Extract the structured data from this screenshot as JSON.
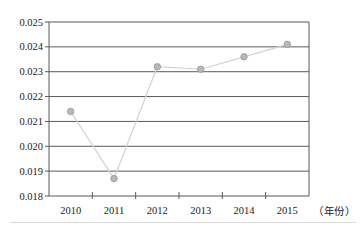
{
  "chart_data": {
    "type": "line",
    "categories": [
      "2010",
      "2011",
      "2012",
      "2013",
      "2014",
      "2015"
    ],
    "series": [
      {
        "name": "series-1",
        "values": [
          0.0214,
          0.0187,
          0.0232,
          0.0231,
          0.0236,
          0.0241
        ]
      }
    ],
    "title": "",
    "xlabel": "（年份）",
    "ylabel": "",
    "ylim": [
      0.018,
      0.025
    ],
    "ytick_step": 0.001,
    "ytick_decimals": 3,
    "grid": "horizontal-only",
    "legend": "none",
    "marker": "circle",
    "colors": {
      "line": "#d5d2c8",
      "marker_fill": "#b8b8b8",
      "marker_stroke": "#9f9f9f",
      "grid": "#595959",
      "axis": "#595959",
      "tick_label": "#1a1a1a",
      "background": "#ffffff",
      "footer_rule": "#d9d9d9"
    }
  }
}
